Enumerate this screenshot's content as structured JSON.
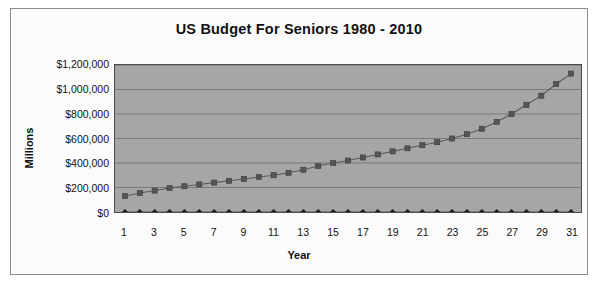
{
  "chart_data": {
    "type": "line",
    "title": "US Budget For Seniors 1980 - 2010",
    "xlabel": "Year",
    "ylabel": "Millions",
    "grid": true,
    "legend": "none",
    "plot_background_color": "#a6a6a6",
    "series_color": "#5a5a5a",
    "xlim": [
      1,
      31
    ],
    "ylim": [
      0,
      1200000
    ],
    "ytick_values": [
      0,
      200000,
      400000,
      600000,
      800000,
      1000000,
      1200000
    ],
    "ytick_labels": [
      "$0",
      "$200,000",
      "$400,000",
      "$600,000",
      "$800,000",
      "$1,000,000",
      "$1,200,000"
    ],
    "x": [
      1,
      2,
      3,
      4,
      5,
      6,
      7,
      8,
      9,
      10,
      11,
      12,
      13,
      14,
      15,
      16,
      17,
      18,
      19,
      20,
      21,
      22,
      23,
      24,
      25,
      26,
      27,
      28,
      29,
      30,
      31
    ],
    "xtick_labels": [
      "1",
      "",
      "3",
      "",
      "5",
      "",
      "7",
      "",
      "9",
      "",
      "11",
      "",
      "13",
      "",
      "15",
      "",
      "17",
      "",
      "19",
      "",
      "21",
      "",
      "23",
      "",
      "25",
      "",
      "27",
      "",
      "29",
      "",
      "31"
    ],
    "series": [
      {
        "name": "budget",
        "marker": "square",
        "values": [
          130000,
          155000,
          175000,
          195000,
          210000,
          225000,
          240000,
          255000,
          270000,
          285000,
          300000,
          320000,
          345000,
          375000,
          400000,
          420000,
          445000,
          470000,
          495000,
          520000,
          545000,
          570000,
          600000,
          635000,
          680000,
          735000,
          800000,
          875000,
          950000,
          1045000,
          1130000
        ]
      },
      {
        "name": "baseline",
        "marker": "diamond",
        "values": [
          0,
          0,
          0,
          0,
          0,
          0,
          0,
          0,
          0,
          0,
          0,
          0,
          0,
          0,
          0,
          0,
          0,
          0,
          0,
          0,
          0,
          0,
          0,
          0,
          0,
          0,
          0,
          0,
          0,
          0,
          0
        ]
      }
    ]
  }
}
